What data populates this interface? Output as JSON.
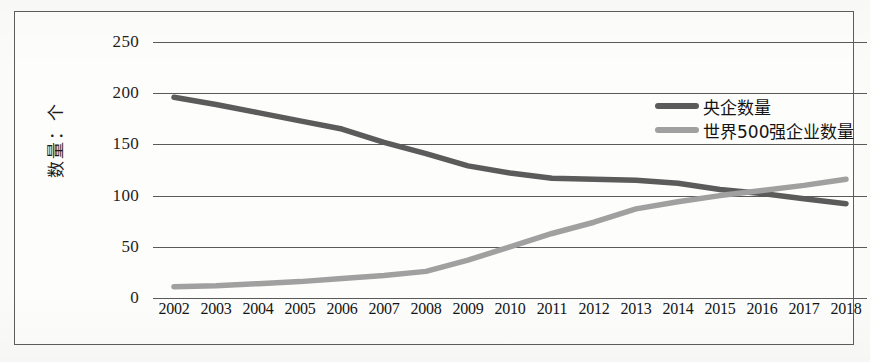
{
  "chart_data": {
    "type": "line",
    "title": "",
    "xlabel": "",
    "ylabel": "数量：个",
    "ylim": [
      0,
      250
    ],
    "yticks": [
      250,
      200,
      150,
      100,
      50,
      0
    ],
    "grid": true,
    "legend_position": "top-right",
    "categories": [
      "2002",
      "2003",
      "2004",
      "2005",
      "2006",
      "2007",
      "2008",
      "2009",
      "2010",
      "2011",
      "2012",
      "2013",
      "2014",
      "2015",
      "2016",
      "2017",
      "2018"
    ],
    "series": [
      {
        "name": "央企数量",
        "color": "#5b5b5b",
        "values": [
          196,
          189,
          181,
          173,
          165,
          152,
          141,
          129,
          122,
          117,
          116,
          115,
          112,
          106,
          102,
          97,
          92
        ]
      },
      {
        "name": "世界500强企业数量",
        "color": "#a0a0a0",
        "values": [
          11,
          12,
          14,
          16,
          19,
          22,
          26,
          37,
          50,
          63,
          74,
          87,
          94,
          100,
          105,
          110,
          116
        ]
      }
    ]
  },
  "axis": {
    "y_ticks": [
      "250",
      "200",
      "150",
      "100",
      "50",
      "0"
    ],
    "y_title": "数量：个",
    "x_ticks": [
      "2002",
      "2003",
      "2004",
      "2005",
      "2006",
      "2007",
      "2008",
      "2009",
      "2010",
      "2011",
      "2012",
      "2013",
      "2014",
      "2015",
      "2016",
      "2017",
      "2018"
    ]
  },
  "legend": {
    "items": [
      {
        "label": "央企数量",
        "color": "#5b5b5b"
      },
      {
        "label": "世界500强企业数量",
        "color": "#a0a0a0"
      }
    ]
  }
}
